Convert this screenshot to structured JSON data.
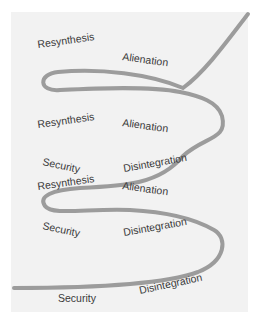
{
  "diagram": {
    "type": "spiral",
    "stroke_color": "#9c9c9c",
    "background_color": "#f2f2f2",
    "cycles": [
      {
        "level": "bottom",
        "labels": {
          "security": "Security",
          "disintegration": "Disintegration"
        }
      },
      {
        "level": "lower",
        "labels": {
          "resynthesis": "Resynthesis",
          "alienation": "Alienation",
          "security": "Security",
          "disintegration": "Disintegration"
        }
      },
      {
        "level": "middle",
        "labels": {
          "resynthesis": "Resynthesis",
          "alienation": "Alienation",
          "security": "Security",
          "disintegration": "Disintegration"
        }
      },
      {
        "level": "top",
        "labels": {
          "resynthesis": "Resynthesis",
          "alienation": "Alienation"
        }
      }
    ]
  }
}
